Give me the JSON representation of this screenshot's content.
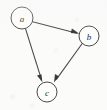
{
  "figure": {
    "type": "directed-graph",
    "background_color": "#fbfbfa",
    "stroke_color": "#4a4a4a",
    "label_color": "#2e2e2e",
    "width": 107,
    "height": 110
  },
  "graph_data": {
    "type": "diagram",
    "directed": true,
    "nodes": [
      {
        "id": "a",
        "label": "a",
        "cx": 22,
        "cy": 18,
        "r": 11
      },
      {
        "id": "b",
        "label": "b",
        "cx": 89,
        "cy": 36,
        "r": 10
      },
      {
        "id": "c",
        "label": "c",
        "cx": 47,
        "cy": 92,
        "r": 10
      }
    ],
    "edges": [
      {
        "from": "a",
        "to": "b",
        "x1": 32.6,
        "y1": 21.8,
        "x2": 79.2,
        "y2": 33.8,
        "arrow": "to"
      },
      {
        "from": "a",
        "to": "c",
        "x1": 25.5,
        "y1": 28.6,
        "x2": 42.4,
        "y2": 82.3,
        "arrow": "to"
      },
      {
        "from": "b",
        "to": "c",
        "x1": 82.4,
        "y1": 43.3,
        "x2": 54.0,
        "y2": 82.6,
        "arrow": "to"
      }
    ]
  }
}
